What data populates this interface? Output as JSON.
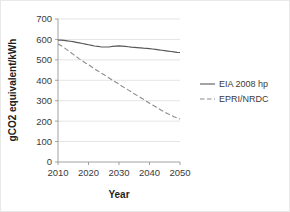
{
  "chart_data": {
    "type": "line",
    "title": "",
    "xlabel": "Year",
    "ylabel": "gCO2 equivalent/kWh",
    "xlim": [
      2010,
      2050
    ],
    "ylim": [
      0,
      700
    ],
    "xticks": [
      2010,
      2020,
      2030,
      2040,
      2050
    ],
    "xtick_labels": [
      "2010",
      "2020",
      "2030",
      "2040",
      "2050"
    ],
    "yticks": [
      0,
      100,
      200,
      300,
      400,
      500,
      600,
      700
    ],
    "ytick_labels": [
      "0",
      "100",
      "200",
      "300",
      "400",
      "500",
      "600",
      "700"
    ],
    "grid": "horizontal",
    "legend_position": "right",
    "x": [
      2010,
      2011,
      2012,
      2013,
      2014,
      2015,
      2016,
      2017,
      2018,
      2019,
      2020,
      2021,
      2022,
      2023,
      2024,
      2025,
      2026,
      2027,
      2028,
      2029,
      2030,
      2031,
      2032,
      2033,
      2034,
      2035,
      2036,
      2037,
      2038,
      2039,
      2040,
      2041,
      2042,
      2043,
      2044,
      2045,
      2046,
      2047,
      2048,
      2049,
      2050
    ],
    "series": [
      {
        "name": "EIA 2008 hp",
        "style": "solid",
        "color": "#595959",
        "values": [
          597,
          597,
          595,
          593,
          591,
          589,
          586,
          583,
          580,
          577,
          574,
          571,
          568,
          566,
          564,
          563,
          563,
          564,
          566,
          567,
          568,
          567,
          566,
          564,
          562,
          561,
          560,
          559,
          557,
          556,
          555,
          553,
          551,
          549,
          547,
          545,
          543,
          541,
          539,
          537,
          536
        ]
      },
      {
        "name": "EPRI/NRDC",
        "style": "dashed",
        "color": "#8c8c8c",
        "values": [
          578,
          570,
          560,
          549,
          538,
          527,
          516,
          505,
          495,
          485,
          476,
          466,
          456,
          447,
          437,
          428,
          418,
          409,
          399,
          390,
          381,
          371,
          362,
          353,
          344,
          334,
          325,
          316,
          307,
          297,
          288,
          279,
          270,
          261,
          252,
          244,
          236,
          229,
          222,
          216,
          210
        ]
      }
    ]
  },
  "legend": {
    "items": [
      {
        "label": "EIA 2008 hp",
        "style": "solid"
      },
      {
        "label": "EPRI/NRDC",
        "style": "dashed"
      }
    ]
  }
}
